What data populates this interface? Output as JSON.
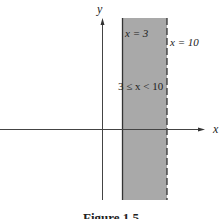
{
  "figure": {
    "caption": "Figure 1.5",
    "axes": {
      "x_label": "x",
      "y_label": "y"
    },
    "region": {
      "label": "3 ≤ x < 10",
      "fill_color": "#a9a9a9",
      "left_boundary": {
        "label": "x = 3",
        "style": "solid",
        "value": 3
      },
      "right_boundary": {
        "label": "x = 10",
        "style": "dashed",
        "value": 10
      }
    }
  }
}
